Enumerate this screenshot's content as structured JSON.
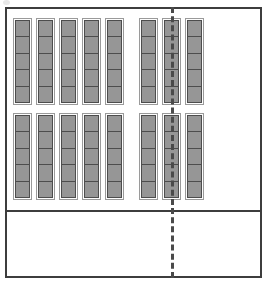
{
  "diagram": {
    "type": "architectural-floor-plan",
    "canvas": {
      "width": 272,
      "height": 286,
      "background": "#ffffff"
    },
    "colors": {
      "outline": "#3d3d3d",
      "dashed_line": "#4a4a4a",
      "module_fill": "#969696",
      "module_stroke": "#4d4d4d",
      "column_stroke": "#9a9a9a",
      "page_background": "#ffffff"
    },
    "outer_frame": {
      "label": "outer boundary",
      "x": 5,
      "y": 7,
      "width": 257,
      "height": 271,
      "stroke_width": 2
    },
    "horizontal_divider": {
      "label": "zone divider",
      "y": 210,
      "x_start": 5,
      "x_end": 262,
      "stroke_width": 2,
      "style": "solid"
    },
    "vertical_center_line": {
      "label": "center axis",
      "x": 172,
      "y_start": 7,
      "y_end": 278,
      "stroke_width": 3,
      "style": "dashed",
      "dash_length": 3,
      "gap_length": 3
    },
    "module_field": {
      "label": "seating module array",
      "x": 13,
      "y": 18,
      "width": 152,
      "height": 182,
      "blocks": [
        {
          "name": "upper-block",
          "row_index": 0,
          "groups": [
            {
              "name": "left-group",
              "column_count": 5,
              "cells_per_column": 5
            },
            {
              "name": "right-group",
              "column_count": 3,
              "cells_per_column": 5
            }
          ]
        },
        {
          "name": "lower-block",
          "row_index": 1,
          "groups": [
            {
              "name": "left-group",
              "column_count": 5,
              "cells_per_column": 5
            },
            {
              "name": "right-group",
              "column_count": 3,
              "cells_per_column": 5
            }
          ]
        }
      ],
      "total_columns": 16,
      "total_modules": 80,
      "column_width": 15,
      "column_gap": 4,
      "group_gap": 15,
      "block_gap": 8
    },
    "regions": [
      {
        "name": "upper-left-region",
        "occupied": true,
        "contents": "module array"
      },
      {
        "name": "upper-right-region",
        "occupied": false,
        "contents": "empty"
      },
      {
        "name": "lower-left-region",
        "occupied": false,
        "contents": "empty"
      },
      {
        "name": "lower-right-region",
        "occupied": false,
        "contents": "empty"
      }
    ]
  }
}
